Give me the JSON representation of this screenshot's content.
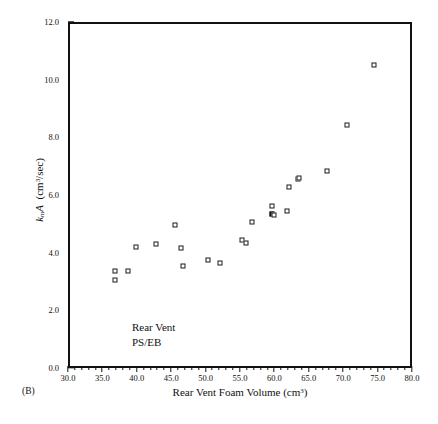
{
  "figure": {
    "panel_label": "(B)"
  },
  "chart_data": {
    "type": "scatter",
    "title": "",
    "xlabel": "Rear Vent Foam Volume (cm³)",
    "ylabel": "kₘA (cm³/sec)",
    "ylabel_parts": {
      "italic_k": "k",
      "subscript": "m",
      "italic_A": "A",
      "units_prefix": " (cm",
      "units_sup": "3",
      "units_suffix": "/sec)"
    },
    "xlabel_parts": {
      "text": "Rear Vent Foam Volume (cm",
      "sup": "3",
      "suffix": ")"
    },
    "xlim": [
      30.0,
      80.0
    ],
    "ylim": [
      0.0,
      12.0
    ],
    "xticks": [
      "30.0",
      "35.0",
      "40.0",
      "45.0",
      "50.0",
      "55.0",
      "60.0",
      "65.0",
      "70.0",
      "75.0",
      "80.0"
    ],
    "yticks": [
      "0.0",
      "2.0",
      "4.0",
      "6.0",
      "8.0",
      "10.0",
      "12.0"
    ],
    "xtick_values": [
      30.0,
      35.0,
      40.0,
      45.0,
      50.0,
      55.0,
      60.0,
      65.0,
      70.0,
      75.0,
      80.0
    ],
    "ytick_values": [
      0.0,
      2.0,
      4.0,
      6.0,
      8.0,
      10.0,
      12.0
    ],
    "xminor_step": 1.0,
    "yminor_step": 0.5,
    "grid": false,
    "legend": false,
    "annotations": [
      {
        "text": "Rear Vent",
        "x": 39.0,
        "y": 1.35
      },
      {
        "text": "PS/EB",
        "x": 39.0,
        "y": 0.95
      }
    ],
    "marker": {
      "shape": "square",
      "fill": "#ffffff",
      "edge": "#1a1a1a",
      "size_px": 5
    },
    "series": [
      {
        "name": "Rear Vent PS/EB",
        "points": [
          {
            "x": 36.5,
            "y": 3.42
          },
          {
            "x": 36.5,
            "y": 3.12
          },
          {
            "x": 38.5,
            "y": 3.45
          },
          {
            "x": 39.6,
            "y": 4.26
          },
          {
            "x": 42.5,
            "y": 4.38
          },
          {
            "x": 45.2,
            "y": 5.03
          },
          {
            "x": 46.2,
            "y": 4.24
          },
          {
            "x": 46.4,
            "y": 3.62
          },
          {
            "x": 50.0,
            "y": 3.83
          },
          {
            "x": 51.8,
            "y": 3.72
          },
          {
            "x": 55.0,
            "y": 4.52
          },
          {
            "x": 55.6,
            "y": 4.4
          },
          {
            "x": 56.5,
            "y": 5.12
          },
          {
            "x": 59.4,
            "y": 5.68
          },
          {
            "x": 59.4,
            "y": 5.4,
            "filled": true
          },
          {
            "x": 59.6,
            "y": 5.36
          },
          {
            "x": 61.5,
            "y": 5.52
          },
          {
            "x": 61.9,
            "y": 6.34
          },
          {
            "x": 63.1,
            "y": 6.62
          },
          {
            "x": 63.3,
            "y": 6.65
          },
          {
            "x": 67.4,
            "y": 6.9
          },
          {
            "x": 70.3,
            "y": 8.5
          },
          {
            "x": 74.2,
            "y": 10.58
          }
        ]
      }
    ]
  }
}
